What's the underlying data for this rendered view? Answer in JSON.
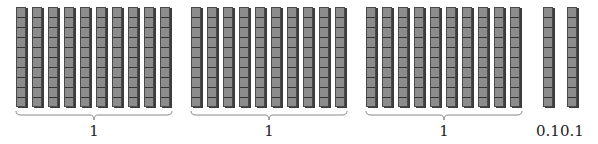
{
  "diagram": {
    "groups": [
      {
        "rods": 10,
        "label": "1",
        "x": 16
      },
      {
        "rods": 10,
        "label": "1",
        "x": 191
      },
      {
        "rods": 10,
        "label": "1",
        "x": 366
      }
    ],
    "singles": [
      {
        "label": "0.1",
        "x": 543
      },
      {
        "label": "0.1",
        "x": 567
      }
    ],
    "colors": {
      "rod_fill": "#8c8c8c",
      "rod_line": "#333333",
      "brace": "#888888",
      "text": "#222222"
    }
  }
}
